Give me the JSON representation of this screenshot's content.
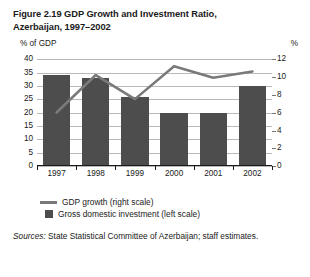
{
  "figure": {
    "title": "Figure 2.19  GDP Growth and Investment Ratio, Azerbaijan, 1997–2002",
    "left_axis_caption": "% of GDP",
    "right_axis_caption": "%",
    "source": "Sources: State Statistical Committee of  Azerbaijan; staff estimates.",
    "source_prefix": "Sources:"
  },
  "legend": {
    "items": [
      {
        "label": "GDP growth (right scale)",
        "marker": "line",
        "color": "#7a7a7a"
      },
      {
        "label": "Gross domestic investment (left scale)",
        "marker": "box",
        "color": "#4d4d4d"
      }
    ]
  },
  "colors": {
    "bar": "#4d4d4d",
    "line": "#7a7a7a",
    "grid": "#b9b9b9",
    "axis": "#1a1a1a",
    "background": "#ffffff"
  },
  "chart_data": {
    "type": "bar",
    "title": "Figure 2.19  GDP Growth and Investment Ratio, Azerbaijan, 1997–2002",
    "xlabel": "",
    "ylabel": "% of GDP",
    "y2label": "%",
    "categories": [
      "1997",
      "1998",
      "1999",
      "2000",
      "2001",
      "2002"
    ],
    "ylim": [
      0,
      40
    ],
    "yticks": [
      0,
      5,
      10,
      15,
      20,
      25,
      30,
      35,
      40
    ],
    "y2lim": [
      0,
      12
    ],
    "y2ticks": [
      0,
      2,
      4,
      6,
      8,
      10,
      12
    ],
    "grid": true,
    "legend_position": "below",
    "series": [
      {
        "name": "Gross domestic investment (left scale)",
        "type": "bar",
        "axis": "left",
        "color": "#4d4d4d",
        "values": [
          34,
          33,
          26,
          20,
          20,
          30
        ]
      },
      {
        "name": "GDP growth (right scale)",
        "type": "line",
        "axis": "right",
        "color": "#7a7a7a",
        "values": [
          6.0,
          10.2,
          7.5,
          11.2,
          9.9,
          10.6
        ]
      }
    ]
  }
}
